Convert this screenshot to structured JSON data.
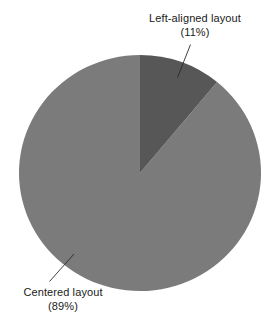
{
  "chart_data": {
    "type": "pie",
    "title": "",
    "xlabel": "",
    "ylabel": "",
    "legend_position": "none",
    "grid": false,
    "labels": [
      "Left-aligned layout",
      "Centered layout"
    ],
    "values": [
      11,
      89
    ],
    "value_unit": "%",
    "slices": [
      {
        "name": "Left-aligned layout",
        "value": 11,
        "percent_text": "(11%)",
        "color": "#575757",
        "start_angle_deg": 0,
        "end_angle_deg": 39.6
      },
      {
        "name": "Centered layout",
        "value": 89,
        "percent_text": "(89%)",
        "color": "#7b7b7b",
        "start_angle_deg": 39.6,
        "end_angle_deg": 360
      }
    ]
  },
  "annotations": {
    "left_aligned": {
      "line1": "Left-aligned layout",
      "line2": "(11%)"
    },
    "centered": {
      "line1": "Centered layout",
      "line2": "(89%)"
    }
  },
  "colors": {
    "background": "#ffffff",
    "slice_dark": "#575757",
    "slice_light": "#7b7b7b",
    "leader_line": "#333333",
    "text": "#1a1a1a"
  }
}
